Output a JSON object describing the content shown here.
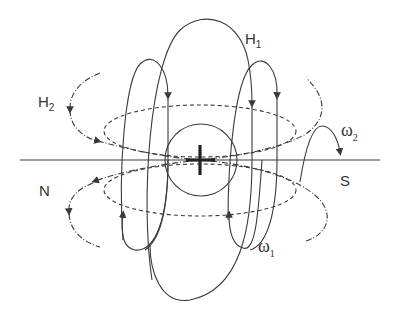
{
  "diagram": {
    "labels": {
      "h1_main": "H",
      "h1_sub": "1",
      "h2_main": "H",
      "h2_sub": "2",
      "omega1_main": "ω",
      "omega1_sub": "1",
      "omega2_main": "ω",
      "omega2_sub": "2",
      "north": "N",
      "south": "S",
      "center": "+"
    },
    "colors": {
      "stroke": "#3a3a3a",
      "text": "#333333"
    }
  }
}
